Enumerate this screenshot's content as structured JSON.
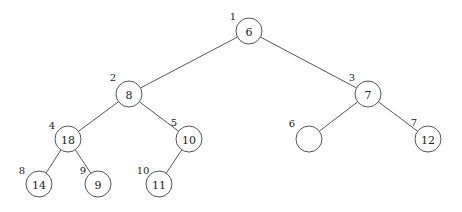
{
  "diagram": {
    "type": "binary-heap-tree",
    "node_radius": 13,
    "colors": {
      "stroke": "#555555",
      "text": "#222222",
      "background": "#ffffff"
    },
    "nodes": [
      {
        "index": "1",
        "value": "6",
        "x": 249,
        "y": 31,
        "label_x": 233,
        "label_y": 16
      },
      {
        "index": "2",
        "value": "8",
        "x": 129,
        "y": 94,
        "label_x": 113,
        "label_y": 77
      },
      {
        "index": "3",
        "value": "7",
        "x": 368,
        "y": 94,
        "label_x": 352,
        "label_y": 77
      },
      {
        "index": "4",
        "value": "18",
        "x": 68,
        "y": 139,
        "label_x": 52,
        "label_y": 125
      },
      {
        "index": "5",
        "value": "10",
        "x": 189,
        "y": 139,
        "label_x": 174,
        "label_y": 122
      },
      {
        "index": "6",
        "value": "",
        "x": 309,
        "y": 139,
        "label_x": 292,
        "label_y": 123
      },
      {
        "index": "7",
        "value": "12",
        "x": 428,
        "y": 139,
        "label_x": 414,
        "label_y": 122
      },
      {
        "index": "8",
        "value": "14",
        "x": 39,
        "y": 184,
        "label_x": 22,
        "label_y": 170
      },
      {
        "index": "9",
        "value": "9",
        "x": 98,
        "y": 184,
        "label_x": 83,
        "label_y": 170
      },
      {
        "index": "10",
        "value": "11",
        "x": 159,
        "y": 184,
        "label_x": 143,
        "label_y": 170
      }
    ],
    "edges": [
      [
        0,
        1
      ],
      [
        0,
        2
      ],
      [
        1,
        3
      ],
      [
        1,
        4
      ],
      [
        2,
        5
      ],
      [
        2,
        6
      ],
      [
        3,
        7
      ],
      [
        3,
        8
      ],
      [
        4,
        9
      ]
    ]
  }
}
